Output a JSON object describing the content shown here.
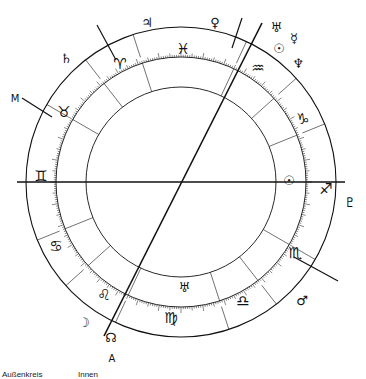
{
  "chart": {
    "center": [
      181,
      182
    ],
    "radius_outer": 155,
    "radius_tick": 125,
    "radius_inner": 95,
    "ink_color": "#111111",
    "axes": [
      {
        "name": "horizon-axis",
        "from": [
          17,
          182
        ],
        "to": [
          345,
          182
        ],
        "width": 1.6
      },
      {
        "name": "meridian-axis",
        "from": [
          104,
          336
        ],
        "to": [
          262,
          23
        ],
        "width": 1.6
      }
    ],
    "signs": [
      {
        "name": "aries",
        "glyph": "♈",
        "x": 120,
        "y": 64
      },
      {
        "name": "taurus",
        "glyph": "♉",
        "x": 64,
        "y": 112
      },
      {
        "name": "gemini",
        "glyph": "♊",
        "x": 41,
        "y": 176
      },
      {
        "name": "cancer",
        "glyph": "♋",
        "x": 56,
        "y": 246
      },
      {
        "name": "leo",
        "glyph": "♌",
        "x": 104,
        "y": 295
      },
      {
        "name": "virgo",
        "glyph": "♍",
        "x": 171,
        "y": 318
      },
      {
        "name": "libra",
        "glyph": "♎",
        "x": 243,
        "y": 301
      },
      {
        "name": "scorpio",
        "glyph": "♏",
        "x": 295,
        "y": 253
      },
      {
        "name": "sagittarius",
        "glyph": "♐",
        "x": 326,
        "y": 189
      },
      {
        "name": "capricorn",
        "glyph": "♑",
        "x": 303,
        "y": 119
      },
      {
        "name": "aquarius",
        "glyph": "♒",
        "x": 258,
        "y": 68
      },
      {
        "name": "pisces",
        "glyph": "♓",
        "x": 183,
        "y": 49
      }
    ],
    "planets": [
      {
        "name": "jupiter",
        "glyph": "♃",
        "x": 147,
        "y": 22
      },
      {
        "name": "saturn",
        "glyph": "♄",
        "x": 66,
        "y": 58
      },
      {
        "name": "venus",
        "glyph": "♀",
        "x": 215,
        "y": 22
      },
      {
        "name": "uranus",
        "glyph": "♅",
        "x": 276,
        "y": 27
      },
      {
        "name": "mercury",
        "glyph": "☿",
        "x": 294,
        "y": 38
      },
      {
        "name": "sun-outer",
        "glyph": "☉",
        "x": 279,
        "y": 48
      },
      {
        "name": "neptune",
        "glyph": "♆",
        "x": 298,
        "y": 63
      },
      {
        "name": "sun-inner",
        "glyph": "☉",
        "x": 289,
        "y": 180
      },
      {
        "name": "pluto",
        "glyph": "♇",
        "x": 350,
        "y": 202
      },
      {
        "name": "mars",
        "glyph": "♂",
        "x": 302,
        "y": 300
      },
      {
        "name": "uranus-inner",
        "glyph": "♅",
        "x": 184,
        "y": 287
      },
      {
        "name": "moon",
        "glyph": "☽",
        "x": 84,
        "y": 322
      },
      {
        "name": "node",
        "glyph": "☊",
        "x": 111,
        "y": 337
      }
    ],
    "labels": [
      {
        "name": "mc-label",
        "text": "M",
        "x": 15,
        "y": 98
      },
      {
        "name": "asc-label",
        "text": "A",
        "x": 112,
        "y": 358
      }
    ],
    "pointer_lines": [
      {
        "from": [
          22,
          98
        ],
        "to": [
          52,
          117
        ]
      },
      {
        "from": [
          97,
          25
        ],
        "to": [
          116,
          60
        ]
      },
      {
        "from": [
          242,
          18
        ],
        "to": [
          232,
          48
        ]
      },
      {
        "from": [
          294,
          257
        ],
        "to": [
          338,
          281
        ]
      }
    ],
    "house_cusps_deg": [
      210,
      232,
      252,
      295,
      318,
      338,
      30,
      52,
      72,
      115,
      138,
      158
    ]
  },
  "captions": {
    "outer": "Außenkreis",
    "inner": "Innen"
  }
}
